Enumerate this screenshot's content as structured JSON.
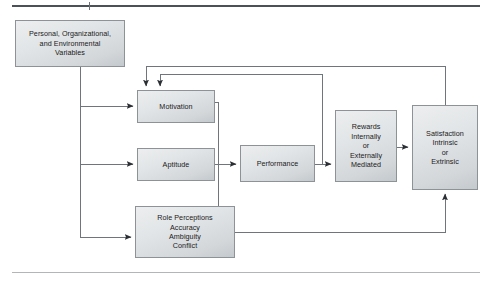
{
  "figure": {
    "type": "flow-diagram",
    "rules": {
      "top_rule_color": "#4a5158",
      "bottom_rule_color": "#b3b6b8"
    },
    "style": {
      "box_border_color": "#8d9296",
      "box_fill_top": "#eceeef",
      "box_fill_bottom": "#c4c9cd",
      "connector_color": "#6e757b",
      "text_color": "#1a1a1a"
    },
    "nodes": [
      {
        "id": "variables",
        "label": "Personal, Organizational,\nand Environmental\nVariables",
        "x": 15,
        "y": 20,
        "w": 110,
        "h": 47
      },
      {
        "id": "motivation",
        "label": "Motivation",
        "x": 137,
        "y": 90,
        "w": 78,
        "h": 33
      },
      {
        "id": "aptitude",
        "label": "Aptitude",
        "x": 137,
        "y": 148,
        "w": 78,
        "h": 33
      },
      {
        "id": "role-perceptions",
        "label": "Role Perceptions\nAccuracy\nAmbiguity\nConflict",
        "x": 135,
        "y": 206,
        "w": 100,
        "h": 52
      },
      {
        "id": "performance",
        "label": "Performance",
        "x": 240,
        "y": 145,
        "w": 75,
        "h": 37
      },
      {
        "id": "rewards",
        "label": "Rewards\nInternally\nor\nExternally\nMediated",
        "x": 335,
        "y": 110,
        "w": 62,
        "h": 72
      },
      {
        "id": "satisfaction",
        "label": "Satisfaction\nIntrinsic\nor\nExtrinsic",
        "x": 412,
        "y": 105,
        "w": 66,
        "h": 85
      }
    ],
    "connections": [
      {
        "from": "variables",
        "to": "motivation",
        "kind": "arrow"
      },
      {
        "from": "variables",
        "to": "aptitude",
        "kind": "arrow"
      },
      {
        "from": "variables",
        "to": "role-perceptions",
        "kind": "arrow"
      },
      {
        "from": "motivation",
        "to": "role-perceptions",
        "kind": "line"
      },
      {
        "from": "aptitude",
        "to": "performance",
        "kind": "arrow"
      },
      {
        "from": "performance",
        "to": "rewards",
        "kind": "arrow"
      },
      {
        "from": "rewards",
        "to": "satisfaction",
        "kind": "arrow"
      },
      {
        "from": "satisfaction",
        "to": "motivation",
        "kind": "feedback-arrow"
      },
      {
        "from": "rewards",
        "to": "motivation",
        "kind": "feedback-arrow"
      },
      {
        "from": "role-perceptions",
        "to": "satisfaction",
        "kind": "feedback-arrow"
      }
    ]
  }
}
